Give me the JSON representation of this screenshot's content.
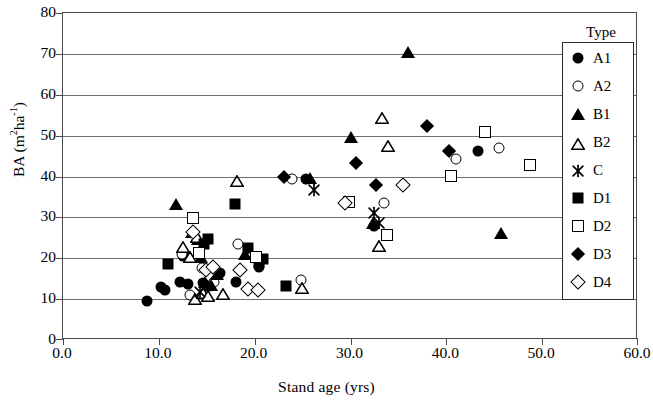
{
  "chart_data": {
    "type": "scatter",
    "title": "",
    "xlabel": "Stand age (yrs)",
    "ylabel": "BA (m2ha-1)",
    "ylabel_display": "BA (m ha )",
    "xlim": [
      0.0,
      60.0
    ],
    "ylim": [
      0,
      80
    ],
    "xticks": [
      "0.0",
      "10.0",
      "20.0",
      "30.0",
      "40.0",
      "50.0",
      "60.0"
    ],
    "xtick_values": [
      0,
      10,
      20,
      30,
      40,
      50,
      60
    ],
    "yticks": [
      "0",
      "10",
      "20",
      "30",
      "40",
      "50",
      "60",
      "70",
      "80"
    ],
    "ytick_values": [
      0,
      10,
      20,
      30,
      40,
      50,
      60,
      70,
      80
    ],
    "grid": "horizontal",
    "legend_title": "Type",
    "legend_position": "top-right-inside",
    "series": [
      {
        "name": "A1",
        "marker": "filled-circle",
        "color": "#000000",
        "points": [
          [
            8.8,
            9.6
          ],
          [
            10.2,
            13.0
          ],
          [
            10.6,
            12.2
          ],
          [
            12.2,
            14.3
          ],
          [
            12.5,
            20.6
          ],
          [
            13.0,
            13.6
          ],
          [
            14.6,
            14.0
          ],
          [
            15.2,
            13.2
          ],
          [
            16.4,
            16.3
          ],
          [
            18.0,
            14.2
          ],
          [
            20.5,
            17.9
          ],
          [
            25.4,
            39.3
          ],
          [
            32.5,
            28.0
          ],
          [
            43.3,
            46.2
          ]
        ]
      },
      {
        "name": "A2",
        "marker": "open-circle",
        "color": "#000000",
        "points": [
          [
            12.4,
            21.1
          ],
          [
            13.2,
            11.0
          ],
          [
            14.5,
            17.5
          ],
          [
            15.8,
            14.3
          ],
          [
            18.3,
            23.6
          ],
          [
            23.9,
            39.3
          ],
          [
            24.8,
            14.8
          ],
          [
            33.5,
            33.6
          ],
          [
            41.0,
            44.4
          ],
          [
            45.5,
            47.0
          ]
        ]
      },
      {
        "name": "B1",
        "marker": "filled-triangle",
        "color": "#000000",
        "points": [
          [
            11.8,
            33.2
          ],
          [
            13.5,
            26.5
          ],
          [
            14.1,
            24.6
          ],
          [
            14.4,
            20.4
          ],
          [
            14.8,
            14.1
          ],
          [
            15.4,
            13.5
          ],
          [
            16.1,
            16.1
          ],
          [
            19.0,
            21.0
          ],
          [
            25.8,
            39.6
          ],
          [
            30.0,
            49.7
          ],
          [
            32.3,
            28.6
          ],
          [
            36.0,
            70.5
          ],
          [
            45.7,
            26.2
          ]
        ]
      },
      {
        "name": "B2",
        "marker": "open-triangle",
        "color": "#000000",
        "points": [
          [
            12.5,
            23.3
          ],
          [
            13.3,
            20.7
          ],
          [
            13.8,
            10.5
          ],
          [
            14.0,
            25.7
          ],
          [
            14.6,
            12.1
          ],
          [
            15.1,
            11.2
          ],
          [
            16.7,
            11.7
          ],
          [
            18.2,
            39.3
          ],
          [
            24.9,
            13.1
          ],
          [
            33.0,
            23.6
          ],
          [
            33.3,
            54.8
          ],
          [
            33.9,
            47.9
          ]
        ]
      },
      {
        "name": "C",
        "marker": "x-star",
        "color": "#000000",
        "points": [
          [
            14.3,
            12.1
          ],
          [
            26.2,
            37.0
          ],
          [
            32.4,
            31.4
          ],
          [
            33.0,
            28.9
          ]
        ]
      },
      {
        "name": "D1",
        "marker": "filled-square",
        "color": "#000000",
        "points": [
          [
            11.0,
            18.6
          ],
          [
            14.7,
            23.4
          ],
          [
            15.1,
            24.7
          ],
          [
            17.9,
            33.2
          ],
          [
            19.3,
            22.6
          ],
          [
            20.4,
            19.0
          ],
          [
            20.9,
            19.7
          ],
          [
            23.3,
            13.1
          ]
        ]
      },
      {
        "name": "D2",
        "marker": "open-square",
        "color": "#000000",
        "points": [
          [
            13.6,
            29.9
          ],
          [
            14.2,
            21.4
          ],
          [
            20.1,
            20.4
          ],
          [
            29.8,
            33.8
          ],
          [
            33.8,
            25.6
          ],
          [
            40.5,
            40.1
          ],
          [
            44.0,
            51.0
          ],
          [
            48.7,
            42.9
          ]
        ]
      },
      {
        "name": "D3",
        "marker": "filled-diamond",
        "color": "#000000",
        "points": [
          [
            23.1,
            40.0
          ],
          [
            30.6,
            43.2
          ],
          [
            32.7,
            38.0
          ],
          [
            38.0,
            52.3
          ],
          [
            40.3,
            46.3
          ]
        ]
      },
      {
        "name": "D4",
        "marker": "open-diamond",
        "color": "#000000",
        "points": [
          [
            13.6,
            26.3
          ],
          [
            14.9,
            17.2
          ],
          [
            15.6,
            17.8
          ],
          [
            18.5,
            17.1
          ],
          [
            19.3,
            12.4
          ],
          [
            20.3,
            12.3
          ],
          [
            29.4,
            33.6
          ],
          [
            35.5,
            37.8
          ]
        ]
      }
    ]
  },
  "legend": {
    "title": "Type",
    "items": [
      {
        "label": "A1",
        "marker": "filled-circle"
      },
      {
        "label": "A2",
        "marker": "open-circle"
      },
      {
        "label": "B1",
        "marker": "filled-triangle"
      },
      {
        "label": "B2",
        "marker": "open-triangle"
      },
      {
        "label": "C",
        "marker": "x-star"
      },
      {
        "label": "D1",
        "marker": "filled-square"
      },
      {
        "label": "D2",
        "marker": "open-square"
      },
      {
        "label": "D3",
        "marker": "filled-diamond"
      },
      {
        "label": "D4",
        "marker": "open-diamond"
      }
    ]
  },
  "axes": {
    "x_title": "Stand age (yrs)",
    "y_title_main": "BA (m",
    "y_title_sup1": "2",
    "y_title_mid": "ha",
    "y_title_sup2": "-1",
    "y_title_end": ")"
  }
}
